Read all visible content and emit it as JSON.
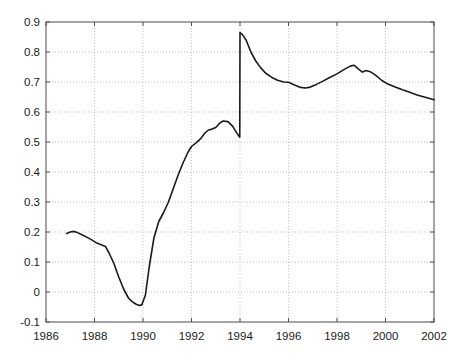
{
  "chart_data": {
    "type": "line",
    "title": "",
    "xlabel": "",
    "ylabel": "",
    "xlim": [
      1986,
      2002
    ],
    "ylim": [
      -0.1,
      0.9
    ],
    "grid": true,
    "grid_style": "dotted",
    "legend": null,
    "legend_position": "none",
    "xticks": [
      1986,
      1988,
      1990,
      1992,
      1994,
      1996,
      1998,
      2000,
      2002
    ],
    "xtick_labels": [
      "1986",
      "1988",
      "1990",
      "1992",
      "1994",
      "1996",
      "1998",
      "2000",
      "2002"
    ],
    "yticks": [
      -0.1,
      0,
      0.1,
      0.2,
      0.3,
      0.4,
      0.5,
      0.6,
      0.7,
      0.8,
      0.9
    ],
    "ytick_labels": [
      "-0.1",
      "0",
      "0.1",
      "0.2",
      "0.3",
      "0.4",
      "0.5",
      "0.6",
      "0.7",
      "0.8",
      "0.9"
    ],
    "line_color": "#1a1a1a",
    "line_width": 1.6,
    "grid_color": "#b4b4b4",
    "axis_color": "#4d4d4d",
    "background_color": "#ffffff",
    "discontinuity_at": 1994.0,
    "annotations": [],
    "series": [
      {
        "name": "series-1",
        "x": [
          1986.85,
          1987.0,
          1987.15,
          1987.3,
          1987.5,
          1987.7,
          1987.9,
          1988.1,
          1988.3,
          1988.45,
          1988.6,
          1988.8,
          1989.0,
          1989.2,
          1989.4,
          1989.55,
          1989.7,
          1989.85,
          1989.95,
          1990.1,
          1990.25,
          1990.45,
          1990.65,
          1990.85,
          1991.05,
          1991.25,
          1991.45,
          1991.65,
          1991.85,
          1992.0,
          1992.2,
          1992.4,
          1992.55,
          1992.7,
          1992.85,
          1993.0,
          1993.15,
          1993.3,
          1993.5,
          1993.7,
          1993.85,
          1993.99,
          1994.0,
          1994.1,
          1994.25,
          1994.45,
          1994.65,
          1994.85,
          1995.05,
          1995.3,
          1995.55,
          1995.8,
          1996.0,
          1996.25,
          1996.5,
          1996.7,
          1996.9,
          1997.15,
          1997.4,
          1997.7,
          1998.0,
          1998.3,
          1998.55,
          1998.7,
          1998.9,
          1999.05,
          1999.2,
          1999.4,
          1999.6,
          1999.85,
          2000.1,
          2000.4,
          2000.7,
          2001.0,
          2001.3,
          2001.6,
          2002.0
        ],
        "y": [
          0.195,
          0.2,
          0.202,
          0.198,
          0.19,
          0.182,
          0.173,
          0.163,
          0.157,
          0.152,
          0.13,
          0.095,
          0.05,
          0.01,
          -0.02,
          -0.032,
          -0.04,
          -0.045,
          -0.043,
          -0.01,
          0.08,
          0.18,
          0.235,
          0.265,
          0.3,
          0.345,
          0.39,
          0.43,
          0.465,
          0.485,
          0.498,
          0.513,
          0.53,
          0.54,
          0.543,
          0.548,
          0.562,
          0.57,
          0.568,
          0.552,
          0.532,
          0.516,
          0.865,
          0.858,
          0.84,
          0.8,
          0.77,
          0.748,
          0.73,
          0.716,
          0.706,
          0.7,
          0.699,
          0.69,
          0.682,
          0.68,
          0.683,
          0.692,
          0.702,
          0.715,
          0.727,
          0.742,
          0.753,
          0.756,
          0.742,
          0.733,
          0.738,
          0.733,
          0.722,
          0.705,
          0.693,
          0.683,
          0.674,
          0.666,
          0.657,
          0.65,
          0.641
        ]
      }
    ]
  }
}
